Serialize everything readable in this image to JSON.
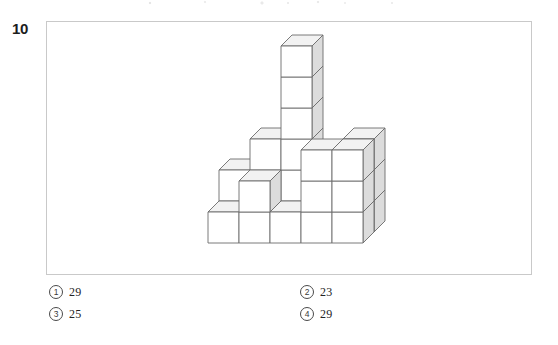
{
  "question": {
    "number": "10",
    "figure_alt": "stacked unit cubes solid"
  },
  "figure": {
    "frame_border_color": "#c9c9c9",
    "cube_outline_color": "#6b6b6b",
    "cube_top_fill": "#f2f2f2",
    "cube_front_fill": "#ffffff",
    "cube_side_fill": "#dcdcdc",
    "projection": "cabinet",
    "cube_size": 31,
    "depth_dx": 11,
    "depth_dy": -11,
    "origin_x": 208,
    "origin_y": 243,
    "cubes": [
      {
        "col": 0,
        "row": 0,
        "level": 0
      },
      {
        "col": 1,
        "row": 0,
        "level": 0
      },
      {
        "col": 2,
        "row": 0,
        "level": 0
      },
      {
        "col": 3,
        "row": 0,
        "level": 0
      },
      {
        "col": 4,
        "row": 0,
        "level": 0
      },
      {
        "col": 1,
        "row": 0,
        "level": 1
      },
      {
        "col": 3,
        "row": 0,
        "level": 1
      },
      {
        "col": 4,
        "row": 0,
        "level": 1
      },
      {
        "col": 3,
        "row": 0,
        "level": 2
      },
      {
        "col": 4,
        "row": 0,
        "level": 2
      },
      {
        "col": 0,
        "row": 1,
        "level": 0
      },
      {
        "col": 1,
        "row": 1,
        "level": 0
      },
      {
        "col": 2,
        "row": 1,
        "level": 0
      },
      {
        "col": 3,
        "row": 1,
        "level": 0
      },
      {
        "col": 4,
        "row": 1,
        "level": 0
      },
      {
        "col": 0,
        "row": 1,
        "level": 1
      },
      {
        "col": 1,
        "row": 1,
        "level": 1
      },
      {
        "col": 2,
        "row": 1,
        "level": 1
      },
      {
        "col": 3,
        "row": 1,
        "level": 1
      },
      {
        "col": 4,
        "row": 1,
        "level": 1
      },
      {
        "col": 1,
        "row": 1,
        "level": 2
      },
      {
        "col": 2,
        "row": 1,
        "level": 2
      },
      {
        "col": 4,
        "row": 1,
        "level": 2
      },
      {
        "col": 2,
        "row": 1,
        "level": 3
      },
      {
        "col": 2,
        "row": 1,
        "level": 4
      },
      {
        "col": 2,
        "row": 1,
        "level": 5
      }
    ]
  },
  "choices": [
    {
      "marker": "1",
      "text": "29"
    },
    {
      "marker": "2",
      "text": "23"
    },
    {
      "marker": "3",
      "text": "25"
    },
    {
      "marker": "4",
      "text": "29"
    }
  ]
}
